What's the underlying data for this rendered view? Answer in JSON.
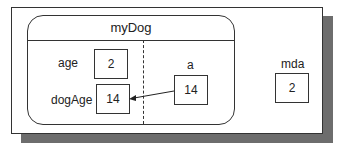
{
  "diagram": {
    "object": {
      "title": "myDog",
      "fields": [
        {
          "name": "age",
          "value": "2"
        },
        {
          "name": "dogAge",
          "value": "14"
        }
      ]
    },
    "parameter": {
      "name": "a",
      "value": "14"
    },
    "local": {
      "name": "mda",
      "value": "2"
    },
    "arrow": {
      "from": "a",
      "to": "dogAge"
    }
  }
}
